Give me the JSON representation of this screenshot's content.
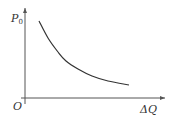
{
  "chart_data": {
    "type": "line",
    "title": "",
    "xlabel": "ΔQ",
    "ylabel": "P",
    "ylabel_subscript": "0",
    "origin_label": "O",
    "series": [
      {
        "name": "P0 vs ΔQ",
        "description": "monotonically decreasing convex curve",
        "points_px": [
          [
            39,
            21
          ],
          [
            48,
            38
          ],
          [
            58,
            52
          ],
          [
            66,
            61
          ],
          [
            78,
            69
          ],
          [
            92,
            76
          ],
          [
            108,
            81
          ],
          [
            129,
            85
          ]
        ]
      }
    ],
    "xlim": null,
    "ylim": null,
    "grid": false,
    "legend": null
  },
  "colors": {
    "axis": "#555555",
    "curve": "#333333",
    "text": "#333333"
  }
}
